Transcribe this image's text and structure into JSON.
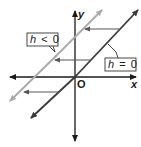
{
  "diagram": {
    "axes": {
      "x_label": "x",
      "y_label": "y",
      "origin_label": "O"
    },
    "lines": [
      {
        "name": "original-line",
        "label": "h = 0",
        "color": "#3a3a3a"
      },
      {
        "name": "shifted-line",
        "label": "h < 0",
        "color": "#a9a9a9"
      }
    ],
    "labels": {
      "shifted": {
        "var": "h",
        "op": "<",
        "val": "0"
      },
      "original": {
        "var": "h",
        "op": "=",
        "val": "0"
      }
    },
    "shift_arrows_direction": "left",
    "shift_arrow_count": 3,
    "colors": {
      "axis": "#1a1a1a",
      "arrow": "#555555",
      "box_border": "#333333"
    }
  }
}
